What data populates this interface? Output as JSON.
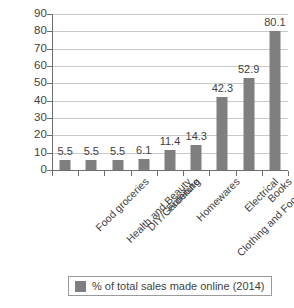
{
  "chart_data": {
    "type": "bar",
    "title": "",
    "xlabel": "",
    "ylabel": "",
    "ylim": [
      0,
      90
    ],
    "ytick_step": 10,
    "yticks": [
      90,
      80,
      70,
      60,
      50,
      40,
      30,
      20,
      10,
      0
    ],
    "grid": true,
    "legend_position": "bottom",
    "categories": [
      "Food groceries",
      "Health and Beauty",
      "DIY/Gardening",
      "Furniture",
      "Homewares",
      "Clothing and Footwear",
      "Electrical",
      "Books",
      "Music and video"
    ],
    "values": [
      5.5,
      5.5,
      5.5,
      6.1,
      11.4,
      14.3,
      42.3,
      52.9,
      80.1
    ],
    "value_labels": [
      "5.5",
      "5.5",
      "5.5",
      "6.1",
      "11.4",
      "14.3",
      "42.3",
      "52.9",
      "80.1"
    ],
    "series": [
      {
        "name": "% of total sales made online (2014)",
        "values": [
          5.5,
          5.5,
          5.5,
          6.1,
          11.4,
          14.3,
          42.3,
          52.9,
          80.1
        ],
        "color": "#7f7f7f"
      }
    ],
    "legend": [
      {
        "label": "% of total sales made online (2014)",
        "color": "#7f7f7f"
      }
    ]
  },
  "colors": {
    "bar": "#7f7f7f",
    "gridline": "#c9c9c9",
    "axis": "#6e6e6e",
    "text": "#3f3f3f",
    "background": "#ffffff"
  }
}
